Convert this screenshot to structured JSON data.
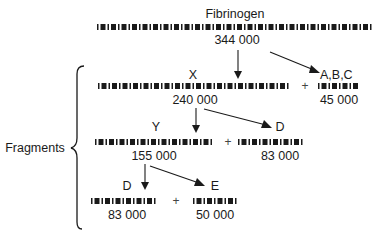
{
  "title": "Fibrinogen",
  "colors": {
    "ink": "#1a1a1a",
    "background": "#ffffff"
  },
  "group_label": "Fragments",
  "nodes": {
    "fibrinogen": {
      "label": "Fibrinogen",
      "mass": "344 000"
    },
    "abc": {
      "label": "A,B,C"
    },
    "x": {
      "label": "X",
      "mass": "240 000"
    },
    "x_byproduct": {
      "mass": "45 000"
    },
    "y": {
      "label": "Y",
      "mass": "155 000"
    },
    "d1": {
      "label": "D",
      "mass": "83 000"
    },
    "d2": {
      "label": "D",
      "mass": "83 000"
    },
    "e": {
      "label": "E",
      "mass": "50 000"
    }
  },
  "operators": {
    "plus": "+"
  },
  "chains": [
    {
      "id": "fibrinogen-chain",
      "x1": 97,
      "x2": 377,
      "y": 27
    },
    {
      "id": "x-chain",
      "x1": 98,
      "x2": 293,
      "y": 86
    },
    {
      "id": "x-byproduct-chain",
      "x1": 318,
      "x2": 359,
      "y": 86
    },
    {
      "id": "y-chain",
      "x1": 95,
      "x2": 217,
      "y": 142
    },
    {
      "id": "d1-chain",
      "x1": 238,
      "x2": 309,
      "y": 142
    },
    {
      "id": "d2-chain",
      "x1": 91,
      "x2": 158,
      "y": 201
    },
    {
      "id": "e-chain",
      "x1": 193,
      "x2": 239,
      "y": 201
    }
  ],
  "edges": [
    {
      "from": "fibrinogen",
      "to": "x"
    },
    {
      "from": "fibrinogen",
      "to": "abc"
    },
    {
      "from": "x",
      "to": "y"
    },
    {
      "from": "x",
      "to": "d1"
    },
    {
      "from": "y",
      "to": "d2"
    },
    {
      "from": "y",
      "to": "e"
    }
  ]
}
